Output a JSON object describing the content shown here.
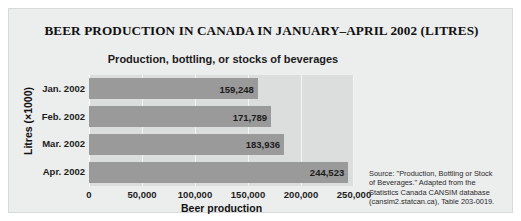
{
  "figure": {
    "title": "BEER PRODUCTION IN CANADA IN JANUARY–APRIL 2002 (LITRES)",
    "background_color": "#eceded",
    "border_color": "#d8dada"
  },
  "source_note": {
    "line1": "Source: \"Production, Bottling or Stock",
    "line2": "of Beverages.\" Adapted from the",
    "line3": "Statistics Canada CANSIM database",
    "line4": "(cansim2.statcan.ca), Table 203-0019."
  },
  "chart_data": {
    "type": "bar",
    "orientation": "horizontal",
    "title": "Production, bottling, or stocks of beverages",
    "xlabel": "Beer production",
    "ylabel": "Litres (×1000)",
    "categories": [
      "Jan. 2002",
      "Feb. 2002",
      "Mar. 2002",
      "Apr. 2002"
    ],
    "values": [
      159248,
      171789,
      183936,
      244523
    ],
    "value_labels": [
      "159,248",
      "171,789",
      "183,936",
      "244,523"
    ],
    "xlim": [
      0,
      250000
    ],
    "xticks": [
      0,
      50000,
      100000,
      150000,
      200000,
      250000
    ],
    "xtick_labels": [
      "0",
      "50,000",
      "100,000",
      "150,000",
      "200,000",
      "250,000"
    ],
    "grid": true,
    "legend": false,
    "bar_color": "#9a9a9a",
    "plot_background": "#dcdddd",
    "gridline_color": "#f3f4f4"
  }
}
